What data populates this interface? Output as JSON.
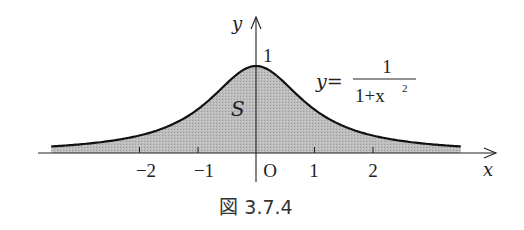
{
  "figure": {
    "caption": "図 3.7.4",
    "region_label": "S",
    "equation": {
      "lhs": "y=",
      "numerator": "1",
      "denominator_base": "1+x",
      "denominator_exp": "2"
    },
    "axes": {
      "x_label": "x",
      "y_label": "y",
      "origin_label": "O",
      "y_tick_label": "1"
    },
    "colors": {
      "fill": "#b8b8b8",
      "curve": "#111111",
      "axis": "#222222"
    }
  },
  "chart_data": {
    "type": "area",
    "title": "",
    "function": "y = 1/(1+x^2)",
    "xlabel": "x",
    "ylabel": "y",
    "x_ticks": [
      -2,
      -1,
      1,
      2
    ],
    "x_tick_labels": [
      "−2",
      "−1",
      "1",
      "2"
    ],
    "y_ticks": [
      1
    ],
    "y_tick_labels": [
      "1"
    ],
    "origin_label": "O",
    "xlim": [
      -3.5,
      3.5
    ],
    "ylim": [
      0,
      1
    ],
    "annotations": [
      {
        "text": "S",
        "meaning": "shaded area under the curve"
      },
      {
        "text": "y = 1/(1+x²)",
        "position": "upper right of peak"
      }
    ],
    "series": [
      {
        "name": "y = 1/(1+x^2)",
        "x": [
          -3.5,
          -3,
          -2.5,
          -2,
          -1.5,
          -1,
          -0.5,
          0,
          0.5,
          1,
          1.5,
          2,
          2.5,
          3,
          3.5
        ],
        "values": [
          0.075,
          0.1,
          0.138,
          0.2,
          0.308,
          0.5,
          0.8,
          1.0,
          0.8,
          0.5,
          0.308,
          0.2,
          0.138,
          0.1,
          0.075
        ]
      }
    ],
    "grid": false,
    "legend": "none",
    "caption": "図 3.7.4"
  }
}
